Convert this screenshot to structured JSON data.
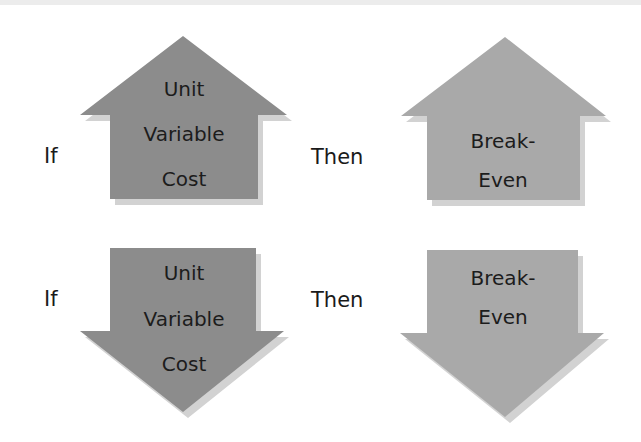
{
  "colors": {
    "cause_fill": "#8c8c8c",
    "effect_fill": "#a9a9a9",
    "shadow": "#d2d2d2",
    "text": "#1c1c1c"
  },
  "rows": [
    {
      "if_label": "If",
      "then_label": "Then",
      "direction": "up",
      "cause": {
        "lines": [
          "Unit",
          "Variable",
          "Cost"
        ]
      },
      "effect": {
        "lines": [
          "Break-",
          "Even"
        ]
      }
    },
    {
      "if_label": "If",
      "then_label": "Then",
      "direction": "down",
      "cause": {
        "lines": [
          "Unit",
          "Variable",
          "Cost"
        ]
      },
      "effect": {
        "lines": [
          "Break-",
          "Even"
        ]
      }
    }
  ]
}
